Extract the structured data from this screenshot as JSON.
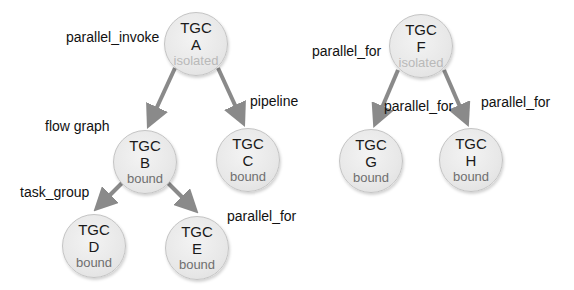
{
  "colors": {
    "arrow": "#8a8a8a",
    "node_fill": "#e8e8e8",
    "bound_text": "#6f6f6f",
    "isolated_text": "#b9b9b9"
  },
  "nodes": [
    {
      "id": "A",
      "title": "TGC",
      "letter": "A",
      "state": "isolated",
      "cx": 196,
      "cy": 44
    },
    {
      "id": "B",
      "title": "TGC",
      "letter": "B",
      "state": "bound",
      "cx": 145,
      "cy": 162
    },
    {
      "id": "C",
      "title": "TGC",
      "letter": "C",
      "state": "bound",
      "cx": 248,
      "cy": 160
    },
    {
      "id": "D",
      "title": "TGC",
      "letter": "D",
      "state": "bound",
      "cx": 94,
      "cy": 246
    },
    {
      "id": "E",
      "title": "TGC",
      "letter": "E",
      "state": "bound",
      "cx": 197,
      "cy": 248
    },
    {
      "id": "F",
      "title": "TGC",
      "letter": "F",
      "state": "isolated",
      "cx": 421,
      "cy": 46
    },
    {
      "id": "G",
      "title": "TGC",
      "letter": "G",
      "state": "bound",
      "cx": 371,
      "cy": 161
    },
    {
      "id": "H",
      "title": "TGC",
      "letter": "H",
      "state": "bound",
      "cx": 471,
      "cy": 160
    }
  ],
  "edges": [
    [
      "A",
      "B"
    ],
    [
      "A",
      "C"
    ],
    [
      "B",
      "D"
    ],
    [
      "B",
      "E"
    ],
    [
      "F",
      "G"
    ],
    [
      "F",
      "H"
    ]
  ],
  "labels": {
    "a": "parallel_invoke",
    "b": "flow graph",
    "c": "pipeline",
    "d": "task_group",
    "e": "parallel_for",
    "f": "parallel_for",
    "g": "parallel_for",
    "h": "parallel_for"
  }
}
